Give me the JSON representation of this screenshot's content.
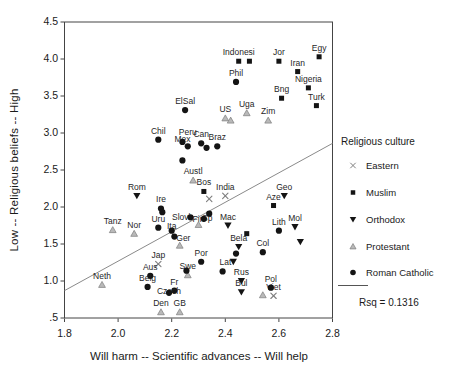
{
  "figure": {
    "background": "#ffffff",
    "marker_color": "#141414",
    "muted_color": "#7d7d7d",
    "protestant_fill": "#b9b9b9",
    "frame_color": "#444444",
    "line_color": "#8a8a8a"
  },
  "legend": {
    "title": "Religious culture",
    "items": [
      {
        "label": "Eastern"
      },
      {
        "label": "Muslim"
      },
      {
        "label": "Orthodox"
      },
      {
        "label": "Protestant"
      },
      {
        "label": "Roman Catholic"
      }
    ],
    "rsq_label": "Rsq = 0.1316"
  },
  "chart_data": {
    "type": "scatter",
    "xlabel": "Will harm -- Scientific advances -- Will help",
    "ylabel": "Low -- Religious beliefs -- High",
    "xlim": [
      1.8,
      2.8
    ],
    "ylim": [
      0.5,
      4.5
    ],
    "grid": false,
    "legend_position": "right",
    "x_ticks": [
      1.8,
      2.0,
      2.2,
      2.4,
      2.6,
      2.8
    ],
    "x_tick_labels": [
      "1.8",
      "2.0",
      "2.2",
      "2.4",
      "2.6",
      "2.8"
    ],
    "y_ticks": [
      0.5,
      1.0,
      1.5,
      2.0,
      2.5,
      3.0,
      3.5,
      4.0,
      4.5
    ],
    "y_tick_labels": [
      ".5",
      "1.0",
      "1.5",
      "2.0",
      "2.5",
      "3.0",
      "3.5",
      "4.0",
      "4.5"
    ],
    "regression_line": {
      "x1": 1.8,
      "y1": 0.87,
      "x2": 2.8,
      "y2": 2.86,
      "rsq": 0.1316
    },
    "series": [
      {
        "name": "Eastern",
        "marker": "x",
        "color": "#7d7d7d",
        "points": [
          {
            "l": "India",
            "x": 2.4,
            "y": 2.15
          },
          {
            "l": "",
            "x": 2.34,
            "y": 2.11
          },
          {
            "l": "Jap",
            "x": 2.15,
            "y": 1.23
          },
          {
            "l": "Viet",
            "x": 2.58,
            "y": 0.8
          }
        ]
      },
      {
        "name": "Muslim",
        "marker": "square",
        "color": "#141414",
        "points": [
          {
            "l": "Indonesi",
            "x": 2.45,
            "y": 3.97
          },
          {
            "l": "",
            "x": 2.49,
            "y": 3.97
          },
          {
            "l": "Jor",
            "x": 2.6,
            "y": 3.97
          },
          {
            "l": "Egy",
            "x": 2.75,
            "y": 4.03
          },
          {
            "l": "Iran",
            "x": 2.67,
            "y": 3.83
          },
          {
            "l": "Nigeria",
            "x": 2.71,
            "y": 3.61
          },
          {
            "l": "Bng",
            "x": 2.61,
            "y": 3.47
          },
          {
            "l": "Turk",
            "x": 2.74,
            "y": 3.37
          },
          {
            "l": "Bos",
            "x": 2.32,
            "y": 2.21
          },
          {
            "l": "Aze",
            "x": 2.58,
            "y": 2.02
          },
          {
            "l": "",
            "x": 2.48,
            "y": 1.64
          }
        ]
      },
      {
        "name": "Orthodox",
        "marker": "triangle-down",
        "color": "#141414",
        "points": [
          {
            "l": "Rom",
            "x": 2.07,
            "y": 2.15
          },
          {
            "l": "Geo",
            "x": 2.62,
            "y": 2.15
          },
          {
            "l": "Mac",
            "x": 2.41,
            "y": 1.75
          },
          {
            "l": "Mol",
            "x": 2.66,
            "y": 1.73
          },
          {
            "l": "",
            "x": 2.68,
            "y": 1.53
          },
          {
            "l": "Bela",
            "x": 2.45,
            "y": 1.46
          },
          {
            "l": "Lat",
            "x": 2.43,
            "y": 1.26,
            "lx": -8,
            "ly": 9
          },
          {
            "l": "Rus",
            "x": 2.46,
            "y": 1.0
          },
          {
            "l": "Bul",
            "x": 2.46,
            "y": 0.85
          }
        ]
      },
      {
        "name": "Protestant",
        "marker": "triangle-up",
        "color": "#b9b9b9",
        "points": [
          {
            "l": "US",
            "x": 2.4,
            "y": 3.2
          },
          {
            "l": "",
            "x": 2.42,
            "y": 3.17
          },
          {
            "l": "Uga",
            "x": 2.48,
            "y": 3.27
          },
          {
            "l": "Zim",
            "x": 2.56,
            "y": 3.17
          },
          {
            "l": "Austl",
            "x": 2.28,
            "y": 2.36
          },
          {
            "l": "Tanz",
            "x": 1.98,
            "y": 1.69
          },
          {
            "l": "Nor",
            "x": 2.06,
            "y": 1.64
          },
          {
            "l": "Fin",
            "x": 2.3,
            "y": 1.76,
            "ly": 3
          },
          {
            "l": "",
            "x": 2.23,
            "y": 1.48
          },
          {
            "l": "Neth",
            "x": 1.94,
            "y": 0.95
          },
          {
            "l": "Swe",
            "x": 2.26,
            "y": 1.08
          },
          {
            "l": "",
            "x": 2.54,
            "y": 0.81
          },
          {
            "l": "Den",
            "x": 2.16,
            "y": 0.58
          },
          {
            "l": "GB",
            "x": 2.23,
            "y": 0.58
          }
        ]
      },
      {
        "name": "Roman Catholic",
        "marker": "circle",
        "color": "#141414",
        "points": [
          {
            "l": "Phil",
            "x": 2.44,
            "y": 3.69
          },
          {
            "l": "ElSal",
            "x": 2.25,
            "y": 3.31
          },
          {
            "l": "Chil",
            "x": 2.15,
            "y": 2.91
          },
          {
            "l": "Mex",
            "x": 2.24,
            "y": 2.88,
            "ly": 6
          },
          {
            "l": "Peru",
            "x": 2.26,
            "y": 2.82,
            "ly": -5
          },
          {
            "l": "Can",
            "x": 2.31,
            "y": 2.86
          },
          {
            "l": "",
            "x": 2.33,
            "y": 2.8
          },
          {
            "l": "Braz",
            "x": 2.37,
            "y": 2.82
          },
          {
            "l": "",
            "x": 2.24,
            "y": 2.63
          },
          {
            "l": "Ire",
            "x": 2.16,
            "y": 1.98
          },
          {
            "l": "",
            "x": 2.165,
            "y": 1.93
          },
          {
            "l": "Uru",
            "x": 2.15,
            "y": 1.72
          },
          {
            "l": "Slovk",
            "x": 2.27,
            "y": 1.86,
            "lx": -8,
            "ly": 9
          },
          {
            "l": "Sp",
            "x": 2.34,
            "y": 1.91,
            "lx": -2,
            "ly": 13
          },
          {
            "l": "",
            "x": 2.32,
            "y": 1.84
          },
          {
            "l": "Ita",
            "x": 2.2,
            "y": 1.68,
            "ly": 4
          },
          {
            "l": "Ger",
            "x": 2.21,
            "y": 1.6,
            "lx": 9,
            "ly": 10
          },
          {
            "l": "Por",
            "x": 2.31,
            "y": 1.26
          },
          {
            "l": "Lith",
            "x": 2.6,
            "y": 1.68
          },
          {
            "l": "Col",
            "x": 2.54,
            "y": 1.39
          },
          {
            "l": "",
            "x": 2.44,
            "y": 1.37
          },
          {
            "l": "",
            "x": 2.39,
            "y": 1.13
          },
          {
            "l": "",
            "x": 2.255,
            "y": 1.14
          },
          {
            "l": "Aus",
            "x": 2.12,
            "y": 1.07
          },
          {
            "l": "Belg",
            "x": 2.11,
            "y": 0.92
          },
          {
            "l": "Fr",
            "x": 2.21,
            "y": 0.87
          },
          {
            "l": "Czech",
            "x": 2.19,
            "y": 0.84,
            "ly": 7
          },
          {
            "l": "Pol",
            "x": 2.57,
            "y": 0.91
          }
        ]
      }
    ]
  }
}
